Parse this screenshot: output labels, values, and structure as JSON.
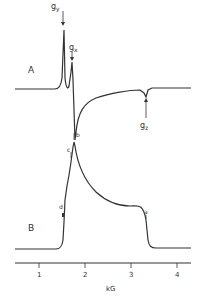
{
  "figure": {
    "spectrum_A": {
      "label": "A",
      "markers": [
        {
          "id": "gy",
          "main": "g",
          "sub": "y"
        },
        {
          "id": "gx",
          "main": "g",
          "sub": "x"
        },
        {
          "id": "gz",
          "main": "g",
          "sub": "z"
        }
      ]
    },
    "spectrum_B": {
      "label": "B",
      "markers": [
        {
          "id": "a",
          "text": "a"
        },
        {
          "id": "b",
          "text": "b"
        },
        {
          "id": "c",
          "text": "c"
        },
        {
          "id": "d",
          "text": "d"
        }
      ]
    },
    "axis": {
      "label": "kG",
      "ticks": [
        "1",
        "2",
        "3",
        "4"
      ]
    },
    "colors": {
      "ink": "#333333",
      "background": "#ffffff"
    }
  }
}
